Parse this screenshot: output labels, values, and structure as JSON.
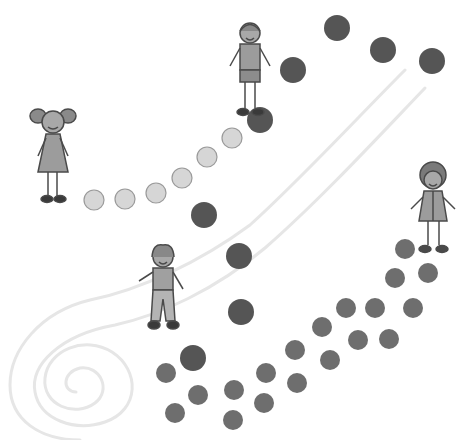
{
  "scene": {
    "description": "Hand-drawn illustration of four children standing along winding paths of dots with a faint spiral trail",
    "background": "#ffffff",
    "colors": {
      "dark_dot": "#555555",
      "mid_dot": "#6e6e6e",
      "light_dot_fill": "#d6d6d6",
      "light_dot_stroke": "#9a9a9a",
      "trail": "#e6e6e6",
      "figure_fill": "#9c9c9c",
      "figure_line": "#4a4a4a"
    },
    "children": [
      {
        "id": "girl-pigtails",
        "label": "Girl with pigtails",
        "x": 52,
        "y": 150
      },
      {
        "id": "boy-top",
        "label": "Boy in shorts",
        "x": 250,
        "y": 60
      },
      {
        "id": "boy-middle",
        "label": "Boy in trousers",
        "x": 163,
        "y": 285
      },
      {
        "id": "boy-right",
        "label": "Boy with curly hair",
        "x": 433,
        "y": 205
      }
    ],
    "light_path": [
      {
        "x": 94,
        "y": 200,
        "r": 10
      },
      {
        "x": 125,
        "y": 199,
        "r": 10
      },
      {
        "x": 156,
        "y": 193,
        "r": 10
      },
      {
        "x": 182,
        "y": 178,
        "r": 10
      },
      {
        "x": 207,
        "y": 157,
        "r": 10
      },
      {
        "x": 232,
        "y": 138,
        "r": 10
      }
    ],
    "dark_path": [
      {
        "x": 260,
        "y": 120,
        "r": 13
      },
      {
        "x": 293,
        "y": 70,
        "r": 13
      },
      {
        "x": 337,
        "y": 28,
        "r": 13
      },
      {
        "x": 383,
        "y": 50,
        "r": 13
      },
      {
        "x": 432,
        "y": 61,
        "r": 13
      },
      {
        "x": 204,
        "y": 215,
        "r": 13
      },
      {
        "x": 239,
        "y": 256,
        "r": 13
      },
      {
        "x": 241,
        "y": 312,
        "r": 13
      },
      {
        "x": 193,
        "y": 358,
        "r": 13
      }
    ],
    "double_path": [
      {
        "x": 405,
        "y": 249,
        "r": 10
      },
      {
        "x": 428,
        "y": 273,
        "r": 10
      },
      {
        "x": 395,
        "y": 278,
        "r": 10
      },
      {
        "x": 346,
        "y": 308,
        "r": 10
      },
      {
        "x": 375,
        "y": 308,
        "r": 10
      },
      {
        "x": 413,
        "y": 308,
        "r": 10
      },
      {
        "x": 322,
        "y": 327,
        "r": 10
      },
      {
        "x": 358,
        "y": 340,
        "r": 10
      },
      {
        "x": 389,
        "y": 339,
        "r": 10
      },
      {
        "x": 295,
        "y": 350,
        "r": 10
      },
      {
        "x": 330,
        "y": 360,
        "r": 10
      },
      {
        "x": 297,
        "y": 383,
        "r": 10
      },
      {
        "x": 266,
        "y": 373,
        "r": 10
      },
      {
        "x": 264,
        "y": 403,
        "r": 10
      },
      {
        "x": 234,
        "y": 390,
        "r": 10
      },
      {
        "x": 233,
        "y": 420,
        "r": 10
      },
      {
        "x": 198,
        "y": 395,
        "r": 10
      },
      {
        "x": 166,
        "y": 373,
        "r": 10
      },
      {
        "x": 175,
        "y": 413,
        "r": 10
      }
    ],
    "spiral": {
      "cx": 72,
      "cy": 378
    }
  }
}
